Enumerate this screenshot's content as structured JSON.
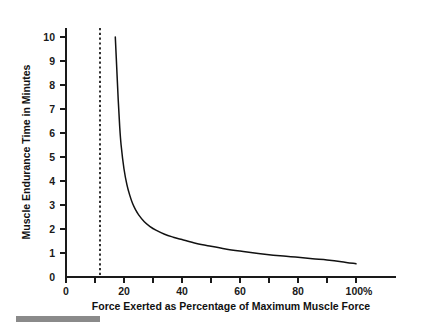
{
  "chart_data": {
    "type": "line",
    "title": "",
    "xlabel": "Force Exerted as Percentage of Maximum Muscle Force",
    "ylabel": "Muscle Endurance Time in Minutes",
    "xlim": [
      0,
      115
    ],
    "ylim": [
      0,
      10.6
    ],
    "grid": false,
    "legend": null,
    "x_tick_labels": [
      "0",
      "20",
      "40",
      "60",
      "80",
      "100%"
    ],
    "x_tick_values": [
      0,
      20,
      40,
      60,
      80,
      100
    ],
    "x_minor_tick_values": [
      10,
      30,
      50,
      70,
      90
    ],
    "y_tick_labels": [
      "0",
      "1",
      "2",
      "3",
      "4",
      "5",
      "6",
      "7",
      "8",
      "9",
      "10"
    ],
    "y_tick_values": [
      0,
      1,
      2,
      3,
      4,
      5,
      6,
      7,
      8,
      9,
      10
    ],
    "annotations": [
      {
        "name": "threshold-dashed-line",
        "style": "dashed-vertical",
        "x": 12,
        "label": ""
      }
    ],
    "series": [
      {
        "name": "Muscle endurance time",
        "x": [
          17,
          17.5,
          18,
          18.5,
          19,
          20,
          21,
          22,
          23,
          24,
          25,
          27,
          29,
          31,
          34,
          37,
          40,
          45,
          50,
          55,
          60,
          65,
          70,
          75,
          80,
          85,
          90,
          95,
          100
        ],
        "values": [
          10.0,
          8.7,
          7.4,
          6.3,
          5.5,
          4.5,
          3.85,
          3.4,
          3.05,
          2.8,
          2.6,
          2.3,
          2.1,
          1.95,
          1.78,
          1.66,
          1.56,
          1.4,
          1.28,
          1.17,
          1.08,
          1.0,
          0.93,
          0.87,
          0.82,
          0.76,
          0.71,
          0.64,
          0.55
        ]
      }
    ]
  },
  "footer": {
    "rule_present": true,
    "rule_color": "#8a8a8a"
  }
}
